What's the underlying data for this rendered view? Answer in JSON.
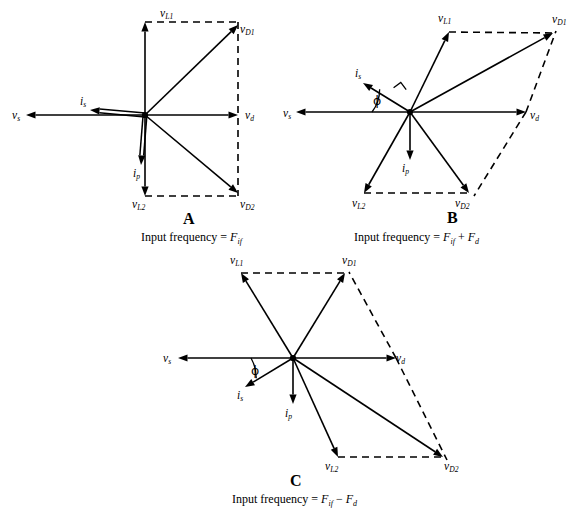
{
  "figure": {
    "background_color": "#ffffff",
    "stroke_color": "#000000",
    "width": 588,
    "height": 513
  },
  "panels": [
    {
      "id": "A",
      "letter": "A",
      "caption_prefix": "Input frequency = ",
      "caption_expr": "F_if",
      "caption_parts": {
        "lead": "Input frequency  =  ",
        "term1_base": "F",
        "term1_sub": "if",
        "operator": "",
        "term2_base": "",
        "term2_sub": ""
      },
      "origin": {
        "x": 145,
        "y": 115
      },
      "vectors": [
        {
          "name": "v_L1",
          "label_base": "v",
          "label_sub": "L1",
          "tip": {
            "x": 145,
            "y": 22
          },
          "style": "solid",
          "label_pos": {
            "x": 160,
            "y": 8
          },
          "label_anchor": "right"
        },
        {
          "name": "v_L2",
          "label_base": "v",
          "label_sub": "L2",
          "tip": {
            "x": 145,
            "y": 196
          },
          "style": "solid",
          "label_pos": {
            "x": 132,
            "y": 199
          },
          "label_anchor": "left"
        },
        {
          "name": "v_D1",
          "label_base": "v",
          "label_sub": "D1",
          "tip": {
            "x": 238,
            "y": 25
          },
          "style": "solid",
          "label_pos": {
            "x": 240,
            "y": 24
          },
          "label_anchor": "left"
        },
        {
          "name": "v_D2",
          "label_base": "v",
          "label_sub": "D2",
          "tip": {
            "x": 238,
            "y": 193
          },
          "style": "solid",
          "label_pos": {
            "x": 240,
            "y": 199
          },
          "label_anchor": "left"
        },
        {
          "name": "v_d",
          "label_base": "v",
          "label_sub": "d",
          "tip": {
            "x": 238,
            "y": 115
          },
          "style": "solid",
          "label_pos": {
            "x": 245,
            "y": 110
          },
          "label_anchor": "left"
        },
        {
          "name": "v_s",
          "label_base": "v",
          "label_sub": "s",
          "tip": {
            "x": 26,
            "y": 115
          },
          "style": "solid",
          "label_pos": {
            "x": 12,
            "y": 110
          },
          "label_anchor": "left"
        },
        {
          "name": "i_s",
          "label_base": "i",
          "label_sub": "s",
          "tip": {
            "x": 90,
            "y": 110
          },
          "style": "double",
          "label_pos": {
            "x": 80,
            "y": 96
          },
          "label_anchor": "left"
        },
        {
          "name": "i_p",
          "label_base": "i",
          "label_sub": "p",
          "tip": {
            "x": 141,
            "y": 165
          },
          "style": "double",
          "label_pos": {
            "x": 133,
            "y": 168
          },
          "label_anchor": "left"
        }
      ],
      "dashed_paths": [
        [
          {
            "x": 145,
            "y": 22
          },
          {
            "x": 238,
            "y": 22
          }
        ],
        [
          {
            "x": 238,
            "y": 22
          },
          {
            "x": 238,
            "y": 196
          }
        ],
        [
          {
            "x": 145,
            "y": 196
          },
          {
            "x": 238,
            "y": 196
          }
        ]
      ],
      "angle_marker": null,
      "letter_pos": {
        "x": 183,
        "y": 211
      },
      "caption_pos": {
        "x": 141,
        "y": 231
      }
    },
    {
      "id": "B",
      "letter": "B",
      "caption_prefix": "Input frequency = ",
      "caption_expr": "F_if + F_d",
      "caption_parts": {
        "lead": "Input frequency  =  ",
        "term1_base": "F",
        "term1_sub": "if",
        "operator": " + ",
        "term2_base": "F",
        "term2_sub": "d"
      },
      "origin": {
        "x": 410,
        "y": 112
      },
      "vectors": [
        {
          "name": "v_L1",
          "label_base": "v",
          "label_sub": "L1",
          "tip": {
            "x": 449,
            "y": 32
          },
          "style": "solid",
          "label_pos": {
            "x": 438,
            "y": 13
          },
          "label_anchor": "left"
        },
        {
          "name": "v_L2",
          "label_base": "v",
          "label_sub": "L2",
          "tip": {
            "x": 364,
            "y": 193
          },
          "style": "solid",
          "label_pos": {
            "x": 352,
            "y": 198
          },
          "label_anchor": "left"
        },
        {
          "name": "v_D1",
          "label_base": "v",
          "label_sub": "D1",
          "tip": {
            "x": 553,
            "y": 33
          },
          "style": "solid",
          "label_pos": {
            "x": 552,
            "y": 14
          },
          "label_anchor": "left"
        },
        {
          "name": "v_D2",
          "label_base": "v",
          "label_sub": "D2",
          "tip": {
            "x": 469,
            "y": 193
          },
          "style": "solid",
          "label_pos": {
            "x": 455,
            "y": 198
          },
          "label_anchor": "left"
        },
        {
          "name": "v_d",
          "label_base": "v",
          "label_sub": "d",
          "tip": {
            "x": 526,
            "y": 112
          },
          "style": "solid",
          "label_pos": {
            "x": 530,
            "y": 110
          },
          "label_anchor": "left"
        },
        {
          "name": "v_s",
          "label_base": "v",
          "label_sub": "s",
          "tip": {
            "x": 296,
            "y": 112
          },
          "style": "solid",
          "label_pos": {
            "x": 283,
            "y": 108
          },
          "label_anchor": "left"
        },
        {
          "name": "i_s",
          "label_base": "i",
          "label_sub": "s",
          "tip": {
            "x": 363,
            "y": 83
          },
          "style": "solid",
          "label_pos": {
            "x": 355,
            "y": 68
          },
          "label_anchor": "left"
        },
        {
          "name": "i_p",
          "label_base": "i",
          "label_sub": "p",
          "tip": {
            "x": 410,
            "y": 160
          },
          "style": "solid",
          "label_pos": {
            "x": 402,
            "y": 163
          },
          "label_anchor": "left"
        }
      ],
      "dashed_paths": [
        [
          {
            "x": 449,
            "y": 32
          },
          {
            "x": 553,
            "y": 33
          }
        ],
        [
          {
            "x": 364,
            "y": 193
          },
          {
            "x": 469,
            "y": 193
          }
        ],
        [
          {
            "x": 526,
            "y": 112
          },
          {
            "x": 556,
            "y": 31
          }
        ],
        [
          {
            "x": 526,
            "y": 112
          },
          {
            "x": 474,
            "y": 196
          }
        ]
      ],
      "angle_marker": {
        "phi_label": "ϕ",
        "phi_pos": {
          "x": 373,
          "y": 95
        },
        "arc": {
          "cx": 410,
          "cy": 112,
          "r": 38,
          "start_deg": 180,
          "end_deg": 143
        },
        "right_angle": {
          "x": 399,
          "y": 95,
          "size": 9,
          "rot_deg": -37
        }
      },
      "letter_pos": {
        "x": 447,
        "y": 210
      },
      "caption_pos": {
        "x": 354,
        "y": 231
      }
    },
    {
      "id": "C",
      "letter": "C",
      "caption_prefix": "Input frequency = ",
      "caption_expr": "F_if - F_d",
      "caption_parts": {
        "lead": "Input frequency  =  ",
        "term1_base": "F",
        "term1_sub": "if",
        "operator": " − ",
        "term2_base": "F",
        "term2_sub": "d"
      },
      "origin": {
        "x": 293,
        "y": 358
      },
      "vectors": [
        {
          "name": "v_L1",
          "label_base": "v",
          "label_sub": "L1",
          "tip": {
            "x": 241,
            "y": 273
          },
          "style": "solid",
          "label_pos": {
            "x": 230,
            "y": 255
          },
          "label_anchor": "left"
        },
        {
          "name": "v_L2",
          "label_base": "v",
          "label_sub": "L2",
          "tip": {
            "x": 338,
            "y": 457
          },
          "style": "solid",
          "label_pos": {
            "x": 325,
            "y": 461
          },
          "label_anchor": "left"
        },
        {
          "name": "v_D1",
          "label_base": "v",
          "label_sub": "D1",
          "tip": {
            "x": 345,
            "y": 273
          },
          "style": "solid",
          "label_pos": {
            "x": 342,
            "y": 255
          },
          "label_anchor": "left"
        },
        {
          "name": "v_D2",
          "label_base": "v",
          "label_sub": "D2",
          "tip": {
            "x": 443,
            "y": 457
          },
          "style": "solid",
          "label_pos": {
            "x": 444,
            "y": 461
          },
          "label_anchor": "left"
        },
        {
          "name": "v_d",
          "label_base": "v",
          "label_sub": "d",
          "tip": {
            "x": 396,
            "y": 358
          },
          "style": "solid",
          "label_pos": {
            "x": 396,
            "y": 353
          },
          "label_anchor": "left"
        },
        {
          "name": "v_s",
          "label_base": "v",
          "label_sub": "s",
          "tip": {
            "x": 178,
            "y": 358
          },
          "style": "solid",
          "label_pos": {
            "x": 163,
            "y": 353
          },
          "label_anchor": "left"
        },
        {
          "name": "i_s",
          "label_base": "i",
          "label_sub": "s",
          "tip": {
            "x": 245,
            "y": 387
          },
          "style": "solid",
          "label_pos": {
            "x": 237,
            "y": 390
          },
          "label_anchor": "left"
        },
        {
          "name": "i_p",
          "label_base": "i",
          "label_sub": "p",
          "tip": {
            "x": 293,
            "y": 404
          },
          "style": "solid",
          "label_pos": {
            "x": 285,
            "y": 408
          },
          "label_anchor": "left"
        }
      ],
      "dashed_paths": [
        [
          {
            "x": 241,
            "y": 273
          },
          {
            "x": 345,
            "y": 273
          }
        ],
        [
          {
            "x": 338,
            "y": 457
          },
          {
            "x": 443,
            "y": 457
          }
        ],
        [
          {
            "x": 396,
            "y": 358
          },
          {
            "x": 349,
            "y": 272
          }
        ],
        [
          {
            "x": 396,
            "y": 358
          },
          {
            "x": 447,
            "y": 460
          }
        ]
      ],
      "angle_marker": {
        "phi_label": "ϕ",
        "phi_pos": {
          "x": 251,
          "y": 365
        },
        "arc": {
          "cx": 293,
          "cy": 358,
          "r": 42,
          "start_deg": 180,
          "end_deg": 209
        },
        "right_angle": null
      },
      "letter_pos": {
        "x": 290,
        "y": 473
      },
      "caption_pos": {
        "x": 232,
        "y": 493
      }
    }
  ],
  "legend_terms": {
    "v_s": "source voltage",
    "v_d": "drive voltage",
    "v_L1": "load voltage 1",
    "v_L2": "load voltage 2",
    "v_D1": "diagonal voltage 1",
    "v_D2": "diagonal voltage 2",
    "i_s": "source current",
    "i_p": "primary current"
  }
}
